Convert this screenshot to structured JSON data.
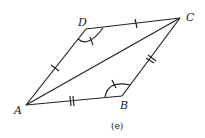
{
  "diagram": {
    "caption": "(e)",
    "vertices": {
      "A": {
        "label": "A",
        "x": 26,
        "y": 105
      },
      "B": {
        "label": "B",
        "x": 122,
        "y": 96
      },
      "C": {
        "label": "C",
        "x": 180,
        "y": 18
      },
      "D": {
        "label": "D",
        "x": 86,
        "y": 29
      }
    },
    "segments": [
      "AB",
      "BC",
      "CD",
      "DA",
      "AC"
    ],
    "marks": {
      "single_tick": [
        "DC",
        "AD"
      ],
      "double_tick": [
        "AB",
        "BC"
      ],
      "angle_arcs": [
        "D",
        "B"
      ]
    },
    "stroke_color": "#222222"
  }
}
